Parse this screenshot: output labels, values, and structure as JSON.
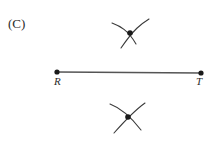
{
  "figure": {
    "part_label": "(C)",
    "background_color": "#ffffff",
    "ink_color": "#3a3a3a",
    "dot_color": "#1a1a1a",
    "segment": {
      "name": "segment-rt",
      "start_label": "R",
      "end_label": "T",
      "start_x": 57,
      "start_y": 72,
      "end_x": 201,
      "end_y": 73,
      "stroke_width": 1.4
    },
    "endpoints": [
      {
        "label": "R",
        "x": 57,
        "y": 72,
        "radius": 2.6
      },
      {
        "label": "T",
        "x": 201,
        "y": 73,
        "radius": 2.6
      }
    ],
    "arc_intersections": [
      {
        "name": "upper",
        "x": 130,
        "y": 33,
        "radius": 2.8
      },
      {
        "name": "lower",
        "x": 128,
        "y": 117,
        "radius": 2.8
      }
    ],
    "arcs": [
      {
        "name": "upper-left-arc",
        "path": "M 112 23 C 120 26 128 30 136 44"
      },
      {
        "name": "upper-right-arc",
        "path": "M 149 19 C 141 24 134 29 121 48"
      },
      {
        "name": "lower-left-arc",
        "path": "M 110 104 C 118 107 128 113 141 130"
      },
      {
        "name": "lower-right-arc",
        "path": "M 145 103 C 138 108 130 115 114 133"
      }
    ],
    "stroke_width_arc": 1.1
  }
}
